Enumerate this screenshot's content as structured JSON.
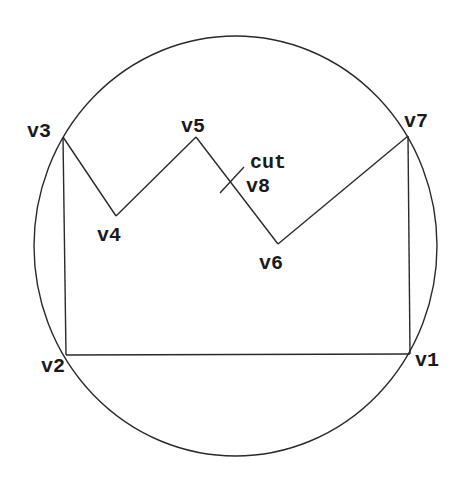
{
  "diagram": {
    "type": "polygon-in-circle",
    "circle": {
      "cx": 235.5,
      "cy": 246,
      "rx": 201.5,
      "ry": 210
    },
    "vertices": [
      {
        "id": "v1",
        "label": "v1",
        "x": 410,
        "y": 354,
        "label_x": 415,
        "label_y": 366
      },
      {
        "id": "v2",
        "label": "v2",
        "x": 66,
        "y": 355,
        "label_x": 41,
        "label_y": 372
      },
      {
        "id": "v3",
        "label": "v3",
        "x": 63,
        "y": 137,
        "label_x": 27,
        "label_y": 137
      },
      {
        "id": "v4",
        "label": "v4",
        "x": 116,
        "y": 216,
        "label_x": 97,
        "label_y": 241
      },
      {
        "id": "v5",
        "label": "v5",
        "x": 196,
        "y": 137,
        "label_x": 181,
        "label_y": 132
      },
      {
        "id": "v6",
        "label": "v6",
        "x": 278,
        "y": 244,
        "label_x": 259,
        "label_y": 269
      },
      {
        "id": "v7",
        "label": "v7",
        "x": 408,
        "y": 136,
        "label_x": 404,
        "label_y": 127
      }
    ],
    "cut": {
      "label": "cut",
      "vertex_label": "v8",
      "x1": 220,
      "y1": 193,
      "x2": 244,
      "y2": 167,
      "cut_label_x": 250,
      "cut_label_y": 168,
      "v8_label_x": 246,
      "v8_label_y": 192
    },
    "labels": {
      "v1": "v1",
      "v2": "v2",
      "v3": "v3",
      "v4": "v4",
      "v5": "v5",
      "v6": "v6",
      "v7": "v7",
      "v8": "v8",
      "cut": "cut"
    },
    "edges": [
      [
        "v1",
        "v2"
      ],
      [
        "v2",
        "v3"
      ],
      [
        "v3",
        "v4"
      ],
      [
        "v4",
        "v5"
      ],
      [
        "v5",
        "v6"
      ],
      [
        "v6",
        "v7"
      ],
      [
        "v7",
        "v1"
      ]
    ],
    "colors": {
      "stroke": "#2a2a2a",
      "text": "#1a1a1a",
      "background": "#ffffff"
    }
  }
}
